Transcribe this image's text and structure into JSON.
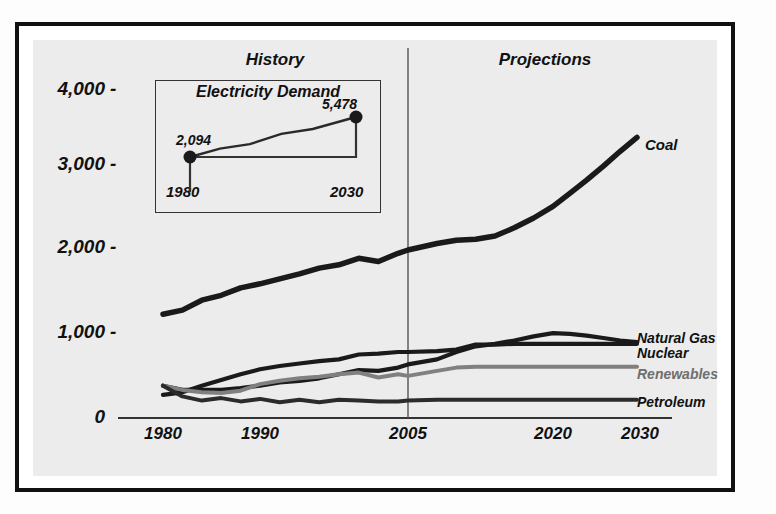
{
  "figure": {
    "phases": {
      "history": "History",
      "projections": "Projections"
    },
    "divider_year": 2005
  },
  "inset": {
    "title": "Electricity Demand",
    "start_label": "2,094",
    "end_label": "5,478",
    "start_year": "1980",
    "end_year": "2030"
  },
  "colors": {
    "coal": "#1a1a1a",
    "natural_gas": "#1a1a1a",
    "nuclear": "#1a1a1a",
    "renewables": "#808080",
    "petroleum": "#2b2b2b",
    "panel_bg": "#ececec",
    "frame": "#111111"
  },
  "chart_data": {
    "type": "line",
    "title": "",
    "subtitle": "",
    "xlabel": "",
    "ylabel": "",
    "grid": false,
    "legend_position": "right-inline",
    "xlim": [
      1980,
      2030
    ],
    "ylim": [
      0,
      4400
    ],
    "yticks": [
      "0",
      "1,000",
      "2,000",
      "3,000",
      "4,000"
    ],
    "ytick_values": [
      0,
      1000,
      2000,
      3000,
      4000
    ],
    "xticks": [
      "1980",
      "1990",
      "2005",
      "2020",
      "2030"
    ],
    "xtick_values": [
      1980,
      1990,
      2005,
      2020,
      2030
    ],
    "annotations": [
      "History",
      "Projections"
    ],
    "series": [
      {
        "name": "Coal",
        "color": "#1a1a1a",
        "x": [
          1980,
          1982,
          1984,
          1986,
          1988,
          1990,
          1992,
          1994,
          1996,
          1998,
          2000,
          2002,
          2004,
          2005,
          2008,
          2010,
          2012,
          2014,
          2016,
          2018,
          2020,
          2022,
          2024,
          2026,
          2028,
          2030
        ],
        "values": [
          1250,
          1300,
          1420,
          1480,
          1570,
          1620,
          1680,
          1740,
          1810,
          1850,
          1930,
          1890,
          1990,
          2030,
          2110,
          2150,
          2160,
          2200,
          2300,
          2420,
          2560,
          2720,
          2880,
          3050,
          3230,
          3400
        ]
      },
      {
        "name": "Natural Gas",
        "color": "#1a1a1a",
        "x": [
          1980,
          1982,
          1984,
          1986,
          1988,
          1990,
          1992,
          1994,
          1996,
          1998,
          2000,
          2002,
          2004,
          2005,
          2008,
          2010,
          2012,
          2014,
          2016,
          2018,
          2020,
          2022,
          2024,
          2026,
          2028,
          2030
        ],
        "values": [
          380,
          330,
          330,
          330,
          350,
          380,
          420,
          440,
          470,
          520,
          570,
          560,
          600,
          640,
          700,
          790,
          860,
          890,
          930,
          980,
          1020,
          1010,
          990,
          960,
          930,
          910
        ]
      },
      {
        "name": "Nuclear",
        "color": "#1a1a1a",
        "x": [
          1980,
          1982,
          1984,
          1986,
          1988,
          1990,
          1992,
          1994,
          1996,
          1998,
          2000,
          2002,
          2004,
          2005,
          2008,
          2010,
          2012,
          2014,
          2016,
          2018,
          2020,
          2022,
          2024,
          2026,
          2028,
          2030
        ],
        "values": [
          270,
          300,
          380,
          450,
          520,
          580,
          620,
          650,
          680,
          700,
          760,
          770,
          790,
          790,
          800,
          820,
          880,
          880,
          890,
          890,
          890,
          890,
          890,
          890,
          890,
          890
        ]
      },
      {
        "name": "Renewables",
        "color": "#808080",
        "x": [
          1980,
          1982,
          1984,
          1986,
          1988,
          1990,
          1992,
          1994,
          1996,
          1998,
          2000,
          2002,
          2004,
          2005,
          2008,
          2010,
          2012,
          2014,
          2016,
          2018,
          2020,
          2022,
          2024,
          2026,
          2028,
          2030
        ],
        "values": [
          380,
          330,
          300,
          290,
          320,
          400,
          440,
          470,
          490,
          520,
          540,
          480,
          520,
          500,
          560,
          600,
          610,
          610,
          610,
          610,
          610,
          610,
          610,
          610,
          610,
          610
        ]
      },
      {
        "name": "Petroleum",
        "color": "#2b2b2b",
        "x": [
          1980,
          1982,
          1984,
          1986,
          1988,
          1990,
          1992,
          1994,
          1996,
          1998,
          2000,
          2002,
          2004,
          2005,
          2008,
          2010,
          2012,
          2014,
          2016,
          2018,
          2020,
          2022,
          2024,
          2026,
          2028,
          2030
        ],
        "values": [
          380,
          250,
          200,
          230,
          190,
          220,
          180,
          210,
          180,
          210,
          200,
          190,
          190,
          200,
          210,
          210,
          210,
          210,
          210,
          210,
          210,
          210,
          210,
          210,
          210,
          210
        ]
      }
    ],
    "inset_chart": {
      "type": "line",
      "title": "Electricity Demand",
      "x": [
        1980,
        2030
      ],
      "values": [
        2094,
        5478
      ],
      "point_labels": [
        "2,094",
        "5,478"
      ]
    }
  },
  "series_labels": {
    "coal": "Coal",
    "natural_gas": "Natural Gas",
    "nuclear": "Nuclear",
    "renewables": "Renewables",
    "petroleum": "Petroleum"
  }
}
